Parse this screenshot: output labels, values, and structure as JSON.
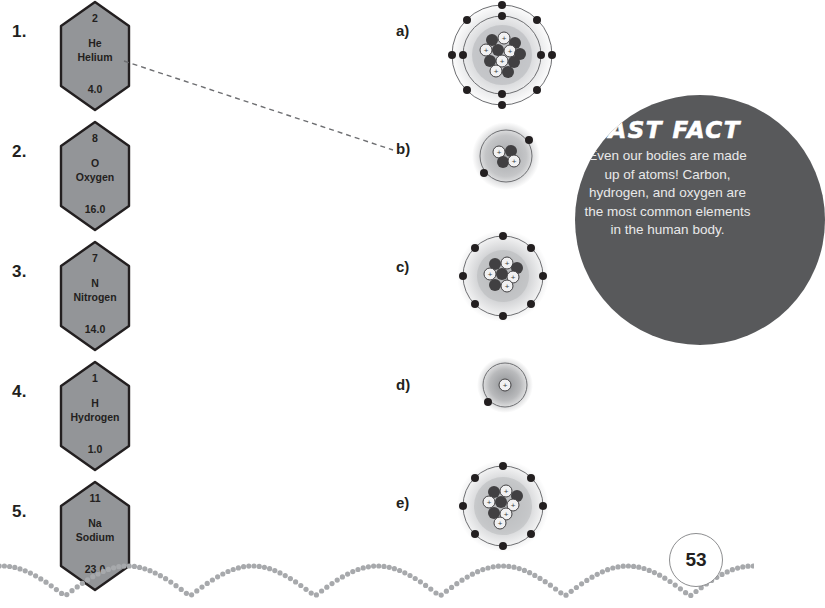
{
  "page": {
    "number": "53",
    "background_color": "#ffffff",
    "text_color": "#231f20"
  },
  "elements": [
    {
      "index": "1.",
      "atomic_number": "2",
      "symbol": "He",
      "name": "Helium",
      "atomic_mass": "4.0",
      "fill_color": "#939598",
      "stroke_color": "#231f20"
    },
    {
      "index": "2.",
      "atomic_number": "8",
      "symbol": "O",
      "name": "Oxygen",
      "atomic_mass": "16.0",
      "fill_color": "#939598",
      "stroke_color": "#231f20"
    },
    {
      "index": "3.",
      "atomic_number": "7",
      "symbol": "N",
      "name": "Nitrogen",
      "atomic_mass": "14.0",
      "fill_color": "#939598",
      "stroke_color": "#231f20"
    },
    {
      "index": "4.",
      "atomic_number": "1",
      "symbol": "H",
      "name": "Hydrogen",
      "atomic_mass": "1.0",
      "fill_color": "#939598",
      "stroke_color": "#231f20"
    },
    {
      "index": "5.",
      "atomic_number": "11",
      "symbol": "Na",
      "name": "Sodium",
      "atomic_mass": "23.0",
      "fill_color": "#939598",
      "stroke_color": "#231f20"
    }
  ],
  "options": [
    {
      "label": "a)",
      "shells": 2,
      "electrons": [
        8,
        4
      ],
      "nucleus_particles": 22,
      "size": "large"
    },
    {
      "label": "b)",
      "shells": 1,
      "electrons": [
        2
      ],
      "nucleus_particles": 4,
      "size": "small"
    },
    {
      "label": "c)",
      "shells": 1,
      "electrons": [
        8
      ],
      "nucleus_particles": 14,
      "size": "medium"
    },
    {
      "label": "d)",
      "shells": 1,
      "electrons": [
        1
      ],
      "nucleus_particles": 1,
      "size": "tiny"
    },
    {
      "label": "e)",
      "shells": 1,
      "electrons": [
        8
      ],
      "nucleus_particles": 16,
      "size": "medium"
    }
  ],
  "connector": {
    "from_element": "1.",
    "to_option": "b)",
    "style": "dashed",
    "color": "#6d6e71"
  },
  "fast_fact": {
    "title": "FAST FACT",
    "body": "Even our bodies are made up of atoms! Carbon, hydrogen, and oxygen are the most common elements in the human body.",
    "circle_color": "#58595b",
    "title_color": "#ffffff",
    "body_color": "#e9e9ea"
  },
  "decoration": {
    "dot_color": "#a7a9ac",
    "border_style": "scalloped-dots"
  }
}
